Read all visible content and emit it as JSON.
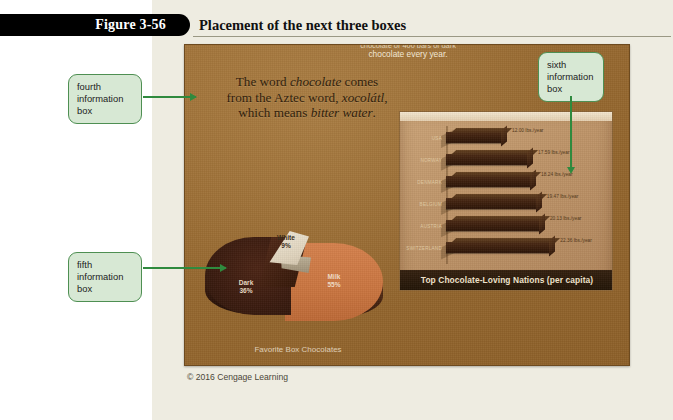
{
  "figure": {
    "tab_label": "Figure 3-56",
    "title": "Placement of the next three boxes"
  },
  "slide": {
    "top_text_clipped": "chocolate or 400 bars of dark",
    "top_text_line2": "chocolate every year.",
    "quote": {
      "l1a": "The word ",
      "l1b": "chocolate",
      "l1c": " comes",
      "l2a": "from the Aztec word, ",
      "l2b": "xocolátl",
      "l2c": ",",
      "l3a": "which means ",
      "l3b": "bitter water",
      "l3c": "."
    },
    "copyright": "© 2016 Cengage Learning"
  },
  "callouts": [
    {
      "id": "fourth",
      "text": "fourth information box"
    },
    {
      "id": "fifth",
      "text": "fifth information box"
    },
    {
      "id": "sixth",
      "text": "sixth information box"
    }
  ],
  "chart_data": [
    {
      "type": "pie",
      "title": "Favorite Box Chocolates",
      "categories": [
        "Milk",
        "Dark",
        "White"
      ],
      "values": [
        55,
        36,
        9
      ],
      "labels": [
        "Milk\n55%",
        "Dark\n36%",
        "White\n9%"
      ],
      "slices": [
        {
          "name": "Milk",
          "percent": 55,
          "label_name": "Milk",
          "label_value": "55%",
          "color": "#c9743f"
        },
        {
          "name": "Dark",
          "percent": 36,
          "label_name": "Dark",
          "label_value": "36%",
          "color": "#3a1b0e"
        },
        {
          "name": "White",
          "percent": 9,
          "label_name": "White",
          "label_value": "9%",
          "color": "#e4d9c4"
        }
      ],
      "legend": "none",
      "unit": "%"
    },
    {
      "type": "bar",
      "orientation": "horizontal",
      "title": "Top Chocolate-Loving Nations (per capita)",
      "categories": [
        "USA",
        "NORWAY",
        "DENMARK",
        "BELGIUM",
        "AUSTRIA",
        "SWITZERLAND"
      ],
      "values": [
        12.0,
        17.59,
        18.24,
        19.47,
        20.13,
        22.36
      ],
      "value_labels": [
        "12.00 lbs./year",
        "17.59 lbs./year",
        "18.24 lbs./year",
        "19.47 lbs./year",
        "20.13 lbs./year",
        "22.36 lbs./year"
      ],
      "xlabel": "",
      "ylabel": "",
      "xlim": [
        0,
        24
      ],
      "grid": false,
      "legend": "none",
      "unit": "lbs./year",
      "bar_color": "#391d0b"
    }
  ],
  "colors": {
    "callout_fill": "#d7e8d4",
    "callout_border": "#4e8f52",
    "arrow": "#2f8a3e",
    "slide_bg": "#9c6d33",
    "page_bg": "#eeece1",
    "tab_bg": "#000000"
  }
}
